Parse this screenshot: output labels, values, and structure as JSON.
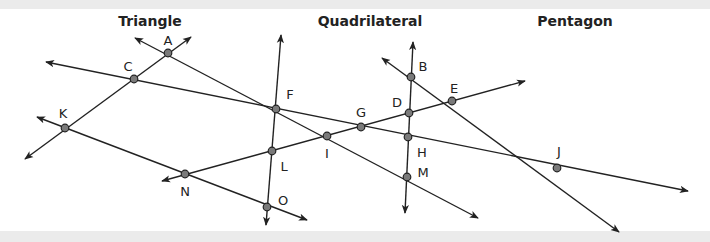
{
  "headings": [
    "Triangle",
    "Quadrilateral",
    "Pentagon"
  ],
  "points": [
    {
      "label": "A"
    },
    {
      "label": "B"
    },
    {
      "label": "C"
    },
    {
      "label": "D"
    },
    {
      "label": "E"
    },
    {
      "label": "F"
    },
    {
      "label": "G"
    },
    {
      "label": "H"
    },
    {
      "label": "I"
    },
    {
      "label": "J"
    },
    {
      "label": "K"
    },
    {
      "label": "L"
    },
    {
      "label": "M"
    },
    {
      "label": "N"
    },
    {
      "label": "O"
    }
  ],
  "lines": [
    {
      "through": [
        "A",
        "C",
        "K"
      ],
      "type": "line"
    },
    {
      "through": [
        "A",
        "F",
        "I",
        "M"
      ],
      "type": "line"
    },
    {
      "through": [
        "C",
        "F",
        "G",
        "H",
        "J"
      ],
      "type": "line"
    },
    {
      "through": [
        "K",
        "N",
        "O"
      ],
      "type": "line"
    },
    {
      "through": [
        "F",
        "L",
        "O"
      ],
      "type": "line"
    },
    {
      "through": [
        "N",
        "L",
        "I",
        "G",
        "D",
        "E"
      ],
      "type": "line"
    },
    {
      "through": [
        "B",
        "D",
        "H",
        "M"
      ],
      "type": "line"
    },
    {
      "through": [
        "B",
        "E",
        "J"
      ],
      "type": "line"
    }
  ]
}
